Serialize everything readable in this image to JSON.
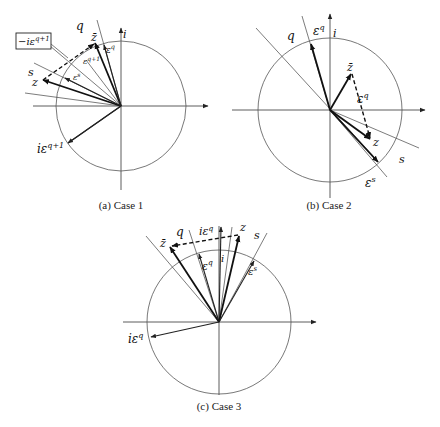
{
  "panels": [
    {
      "id": "case1",
      "caption": "(a) Case 1",
      "labels": {
        "q": "q",
        "s": "s",
        "i": "i",
        "z": "z",
        "zbar": "z̄",
        "eps_q": "ε",
        "eps_q_sup": "q",
        "eps_q1": "ε",
        "eps_q1_sup": "q+1",
        "eps_s": "ε",
        "eps_s_sup": "s",
        "i_eps_q1": "iε",
        "i_eps_q1_sup": "q+1",
        "neg_i_eps_q1": "−iε",
        "neg_i_eps_q1_sup": "q+1"
      }
    },
    {
      "id": "case2",
      "caption": "(b) Case 2",
      "labels": {
        "q": "q",
        "s": "s",
        "i": "i",
        "z": "z",
        "zbar": "z̄",
        "eps_q_top": "ε",
        "eps_q_top_sup": "q",
        "eps_q_mid": "ε",
        "eps_q_mid_sup": "q",
        "eps_s": "ε",
        "eps_s_sup": "s"
      }
    },
    {
      "id": "case3",
      "caption": "(c) Case 3",
      "labels": {
        "q": "q",
        "s": "s",
        "i": "i",
        "z": "z",
        "zbar": "z̄",
        "i_eps_q_top": "iε",
        "i_eps_q_top_sup": "q",
        "eps_q": "ε",
        "eps_q_sup": "q",
        "eps_s": "ε",
        "eps_s_sup": "s",
        "i_eps_q": "iε",
        "i_eps_q_sup": "q"
      }
    }
  ]
}
